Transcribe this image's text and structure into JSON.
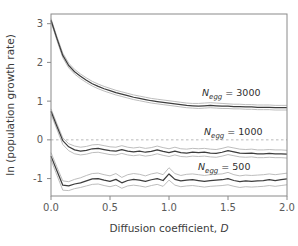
{
  "chart_data": {
    "type": "line",
    "title": "",
    "xlabel": "Diffusion coefficient, D",
    "ylabel": "ln (population growth rate)",
    "xlim": [
      0.0,
      2.0
    ],
    "ylim": [
      -1.45,
      3.25
    ],
    "xticks": [
      "0.0",
      "0.5",
      "1.0",
      "1.5",
      "2.0"
    ],
    "xtick_values": [
      0.0,
      0.5,
      1.0,
      1.5,
      2.0
    ],
    "yticks": [
      "3",
      "2",
      "1",
      "0",
      "-1"
    ],
    "ytick_values": [
      3,
      2,
      1,
      0,
      -1
    ],
    "grid": false,
    "legend_position": "inline-annotations",
    "reference_lines": [
      {
        "name": "zero-line",
        "orientation": "horizontal",
        "value": 0,
        "style": "dashed",
        "color": "#b9b9b9"
      }
    ],
    "x": [
      0.0,
      0.05,
      0.1,
      0.15,
      0.2,
      0.25,
      0.3,
      0.35,
      0.4,
      0.45,
      0.5,
      0.55,
      0.6,
      0.65,
      0.7,
      0.75,
      0.8,
      0.85,
      0.9,
      0.95,
      1.0,
      1.05,
      1.1,
      1.15,
      1.2,
      1.25,
      1.3,
      1.35,
      1.4,
      1.45,
      1.5,
      1.55,
      1.6,
      1.65,
      1.7,
      1.75,
      1.8,
      1.85,
      1.9,
      1.95,
      2.0
    ],
    "series": [
      {
        "name": "N_egg = 3000",
        "label": "3000",
        "color": "#3d3d3d",
        "band_color": "#b5b5b5",
        "values": [
          3.09,
          2.62,
          2.18,
          1.92,
          1.76,
          1.64,
          1.54,
          1.45,
          1.38,
          1.32,
          1.27,
          1.22,
          1.18,
          1.14,
          1.1,
          1.07,
          1.04,
          1.01,
          0.99,
          0.97,
          0.95,
          0.93,
          0.91,
          0.89,
          0.88,
          0.87,
          0.88,
          0.89,
          0.88,
          0.87,
          0.87,
          0.86,
          0.86,
          0.85,
          0.85,
          0.84,
          0.84,
          0.84,
          0.83,
          0.83,
          0.83
        ],
        "upper": [
          3.13,
          2.67,
          2.24,
          1.98,
          1.82,
          1.7,
          1.6,
          1.51,
          1.44,
          1.38,
          1.33,
          1.28,
          1.24,
          1.2,
          1.16,
          1.13,
          1.1,
          1.07,
          1.05,
          1.03,
          1.01,
          0.99,
          0.97,
          0.95,
          0.94,
          0.94,
          0.95,
          0.96,
          0.95,
          0.94,
          0.93,
          0.92,
          0.92,
          0.91,
          0.91,
          0.9,
          0.9,
          0.9,
          0.89,
          0.89,
          0.89
        ],
        "lower": [
          3.05,
          2.57,
          2.12,
          1.86,
          1.7,
          1.58,
          1.48,
          1.39,
          1.32,
          1.26,
          1.21,
          1.16,
          1.12,
          1.08,
          1.04,
          1.01,
          0.98,
          0.95,
          0.93,
          0.91,
          0.89,
          0.87,
          0.85,
          0.83,
          0.82,
          0.81,
          0.82,
          0.83,
          0.82,
          0.81,
          0.81,
          0.8,
          0.8,
          0.79,
          0.79,
          0.78,
          0.78,
          0.78,
          0.77,
          0.77,
          0.77
        ]
      },
      {
        "name": "N_egg = 1000",
        "label": "1000",
        "color": "#3d3d3d",
        "band_color": "#b5b5b5",
        "values": [
          0.74,
          0.35,
          -0.02,
          -0.18,
          -0.26,
          -0.29,
          -0.27,
          -0.23,
          -0.22,
          -0.25,
          -0.28,
          -0.29,
          -0.25,
          -0.29,
          -0.31,
          -0.29,
          -0.32,
          -0.3,
          -0.26,
          -0.3,
          -0.33,
          -0.29,
          -0.33,
          -0.34,
          -0.32,
          -0.33,
          -0.32,
          -0.34,
          -0.35,
          -0.32,
          -0.28,
          -0.31,
          -0.34,
          -0.35,
          -0.34,
          -0.36,
          -0.36,
          -0.35,
          -0.36,
          -0.36,
          -0.37
        ],
        "upper": [
          0.8,
          0.42,
          0.05,
          -0.1,
          -0.16,
          -0.19,
          -0.17,
          -0.13,
          -0.12,
          -0.15,
          -0.18,
          -0.19,
          -0.15,
          -0.19,
          -0.21,
          -0.19,
          -0.22,
          -0.2,
          -0.16,
          -0.2,
          -0.23,
          -0.19,
          -0.23,
          -0.24,
          -0.22,
          -0.23,
          -0.22,
          -0.24,
          -0.25,
          -0.22,
          -0.18,
          -0.21,
          -0.24,
          -0.25,
          -0.24,
          -0.26,
          -0.26,
          -0.25,
          -0.26,
          -0.26,
          -0.27
        ],
        "lower": [
          0.66,
          0.27,
          -0.12,
          -0.28,
          -0.36,
          -0.39,
          -0.37,
          -0.33,
          -0.32,
          -0.35,
          -0.38,
          -0.39,
          -0.35,
          -0.39,
          -0.41,
          -0.39,
          -0.42,
          -0.4,
          -0.36,
          -0.4,
          -0.43,
          -0.39,
          -0.43,
          -0.44,
          -0.42,
          -0.43,
          -0.42,
          -0.44,
          -0.45,
          -0.42,
          -0.38,
          -0.41,
          -0.44,
          -0.45,
          -0.44,
          -0.46,
          -0.46,
          -0.45,
          -0.46,
          -0.46,
          -0.47
        ]
      },
      {
        "name": "N_egg = 500",
        "label": "500",
        "color": "#3d3d3d",
        "band_color": "#b5b5b5",
        "values": [
          -0.42,
          -0.8,
          -1.17,
          -1.19,
          -1.14,
          -1.11,
          -1.06,
          -1.01,
          -1.0,
          -1.04,
          -1.07,
          -1.02,
          -1.11,
          -1.05,
          -1.02,
          -1.04,
          -1.07,
          -1.03,
          -1.0,
          -1.05,
          -0.88,
          -1.02,
          -1.06,
          -1.04,
          -1.03,
          -1.05,
          -1.07,
          -1.05,
          -1.04,
          -1.03,
          -1.0,
          -1.05,
          -1.08,
          -1.06,
          -1.07,
          -1.06,
          -1.05,
          -1.03,
          -1.05,
          -1.03,
          -1.01
        ],
        "upper": [
          -0.33,
          -0.7,
          -1.06,
          -1.08,
          -1.02,
          -0.98,
          -0.92,
          -0.87,
          -0.86,
          -0.9,
          -0.93,
          -0.87,
          -0.97,
          -0.9,
          -0.87,
          -0.89,
          -0.93,
          -0.88,
          -0.85,
          -0.9,
          -0.72,
          -0.87,
          -0.92,
          -0.89,
          -0.88,
          -0.9,
          -0.92,
          -0.9,
          -0.89,
          -0.88,
          -0.84,
          -0.9,
          -0.93,
          -0.91,
          -0.92,
          -0.91,
          -0.9,
          -0.88,
          -0.9,
          -0.88,
          -0.86
        ],
        "lower": [
          -0.52,
          -0.91,
          -1.3,
          -1.31,
          -1.26,
          -1.23,
          -1.19,
          -1.15,
          -1.14,
          -1.18,
          -1.21,
          -1.17,
          -1.25,
          -1.19,
          -1.17,
          -1.19,
          -1.22,
          -1.18,
          -1.15,
          -1.2,
          -1.04,
          -1.17,
          -1.21,
          -1.19,
          -1.18,
          -1.2,
          -1.22,
          -1.2,
          -1.19,
          -1.18,
          -1.16,
          -1.2,
          -1.23,
          -1.21,
          -1.22,
          -1.21,
          -1.2,
          -1.18,
          -1.2,
          -1.18,
          -1.16
        ]
      }
    ],
    "annotations": [
      {
        "name": "annotation-negg-3000",
        "var": "N",
        "sub": "egg",
        "eq": " =  3000",
        "x_px": 202,
        "y_px": 96
      },
      {
        "name": "annotation-negg-1000",
        "var": "N",
        "sub": "egg",
        "eq": " = 1000",
        "x_px": 204,
        "y_px": 135
      },
      {
        "name": "annotation-negg-500",
        "var": "N",
        "sub": "egg",
        "eq": " = 500",
        "x_px": 198,
        "y_px": 170
      }
    ]
  },
  "colors": {
    "frame": "#8a8a8a",
    "line": "#3d3d3d",
    "band": "#b5b5b5",
    "zero_line": "#bdbdbd",
    "text": "#3c3c3c",
    "background": "#ffffff"
  }
}
